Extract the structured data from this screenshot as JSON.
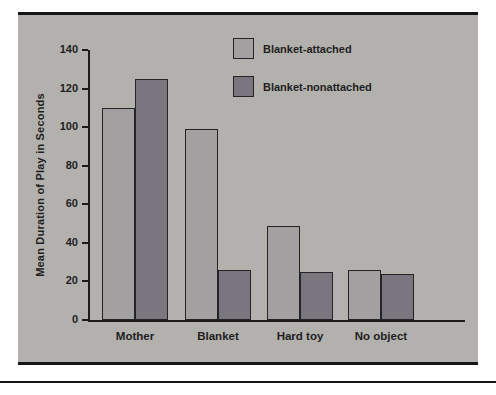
{
  "page": {
    "background_color": "#ffffff",
    "panel_color": "#b3b1ae",
    "rule_color": "#141414",
    "text_color": "#1e1e1e"
  },
  "chart_data": {
    "type": "bar",
    "title": "",
    "xlabel": "",
    "ylabel": "Mean Duration of Play in Seconds",
    "categories": [
      "Mother",
      "Blanket",
      "Hard toy",
      "No object"
    ],
    "series": [
      {
        "name": "Blanket-attached",
        "color": "#a3a0a1",
        "values": [
          110,
          99,
          49,
          26
        ]
      },
      {
        "name": "Blanket-nonattached",
        "color": "#797680",
        "values": [
          125,
          26,
          25,
          24
        ]
      }
    ],
    "ylim": [
      0,
      140
    ],
    "yticks": [
      0,
      20,
      40,
      60,
      80,
      100,
      120,
      140
    ],
    "grid": false,
    "legend_position": "top-center-inside"
  }
}
